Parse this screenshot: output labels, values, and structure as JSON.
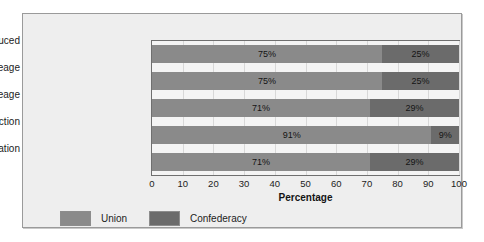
{
  "chart_data": {
    "type": "bar",
    "orientation": "horizontal",
    "stacked": true,
    "stacked_percent": true,
    "title": "",
    "xlabel": "Percentage",
    "ylabel": "",
    "xlim": [
      0,
      100
    ],
    "xticks": [
      0,
      10,
      20,
      30,
      40,
      50,
      60,
      70,
      80,
      90,
      100
    ],
    "xtick_labels": [
      "0",
      "10",
      "20",
      "30",
      "40",
      "50",
      "60",
      "70",
      "80",
      "90",
      "100"
    ],
    "grid": true,
    "legend_position": "bottom-left",
    "categories": [
      "Wealth Produced",
      "Farm Acreage",
      "Railroad Mileage",
      "Factory Production",
      "Total Population"
    ],
    "series": [
      {
        "name": "Union",
        "color": "#8a8a8a",
        "values": [
          75,
          75,
          71,
          91,
          71
        ],
        "labels": [
          "75%",
          "75%",
          "71%",
          "91%",
          "71%"
        ]
      },
      {
        "name": "Confederacy",
        "color": "#6b6b6b",
        "values": [
          25,
          25,
          29,
          9,
          29
        ],
        "labels": [
          "25%",
          "25%",
          "29%",
          "9%",
          "29%"
        ]
      }
    ]
  },
  "legend": {
    "items": [
      {
        "label": "Union",
        "color": "#8a8a8a"
      },
      {
        "label": "Confederacy",
        "color": "#6b6b6b"
      }
    ]
  },
  "axis": {
    "x_title": "Percentage"
  },
  "colors": {
    "panel_background": "#eeeeee",
    "plot_background": "#f4f4f4",
    "frame_border": "#9a9a9a",
    "plot_border": "#6f6f6f",
    "union": "#8a8a8a",
    "confederacy": "#6b6b6b",
    "text": "#1c1c1c"
  }
}
